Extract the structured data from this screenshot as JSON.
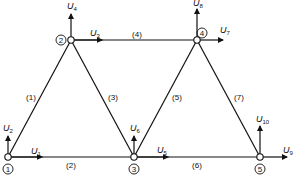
{
  "diagram": {
    "type": "truss",
    "colors": {
      "stroke": "#111111",
      "background": "#ffffff",
      "node_fill": "#ffffff"
    },
    "nodes": [
      {
        "id": "1",
        "label": "1",
        "x": 8,
        "y": 157
      },
      {
        "id": "2",
        "label": "2",
        "x": 71,
        "y": 40
      },
      {
        "id": "3",
        "label": "3",
        "x": 134,
        "y": 157
      },
      {
        "id": "4",
        "label": "4",
        "x": 197,
        "y": 40
      },
      {
        "id": "5",
        "label": "5",
        "x": 260,
        "y": 157
      }
    ],
    "members": [
      {
        "label": "(1)",
        "from": "1",
        "to": "2"
      },
      {
        "label": "(2)",
        "from": "1",
        "to": "3"
      },
      {
        "label": "(3)",
        "from": "2",
        "to": "3"
      },
      {
        "label": "(4)",
        "from": "2",
        "to": "4"
      },
      {
        "label": "(5)",
        "from": "3",
        "to": "4"
      },
      {
        "label": "(6)",
        "from": "3",
        "to": "5"
      },
      {
        "label": "(7)",
        "from": "4",
        "to": "5"
      }
    ],
    "dofs": [
      {
        "base": "U",
        "sub": "1",
        "node": "1",
        "dir": "x"
      },
      {
        "base": "U",
        "sub": "2",
        "node": "1",
        "dir": "y"
      },
      {
        "base": "U",
        "sub": "3",
        "node": "2",
        "dir": "x"
      },
      {
        "base": "U",
        "sub": "4",
        "node": "2",
        "dir": "y"
      },
      {
        "base": "U",
        "sub": "5",
        "node": "3",
        "dir": "x"
      },
      {
        "base": "U",
        "sub": "6",
        "node": "3",
        "dir": "y"
      },
      {
        "base": "U",
        "sub": "7",
        "node": "4",
        "dir": "x"
      },
      {
        "base": "U",
        "sub": "8",
        "node": "4",
        "dir": "y"
      },
      {
        "base": "U",
        "sub": "9",
        "node": "5",
        "dir": "x"
      },
      {
        "base": "U",
        "sub": "10",
        "node": "5",
        "dir": "y"
      }
    ]
  },
  "labels": {
    "m1": "(1)",
    "m2": "(2)",
    "m3": "(3)",
    "m4": "(4)",
    "m5": "(5)",
    "m6": "(6)",
    "m7": "(7)",
    "n1": "1",
    "n2": "2",
    "n3": "3",
    "n4": "4",
    "n5": "5",
    "U": "U",
    "s1": "1",
    "s2": "2",
    "s3": "3",
    "s4": "4",
    "s5": "5",
    "s6": "6",
    "s7": "7",
    "s8": "8",
    "s9": "9",
    "s10": "10"
  }
}
